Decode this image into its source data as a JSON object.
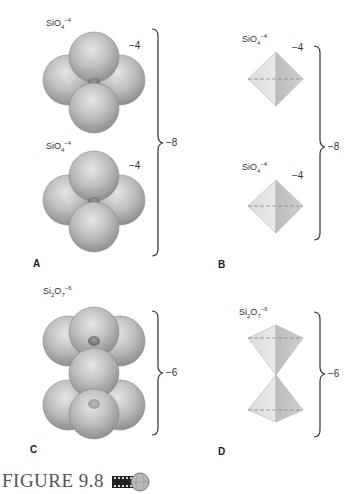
{
  "figure": {
    "caption": "FIGURE 9.8",
    "media_icon": "video-film-globe-icon"
  },
  "panels": {
    "A": {
      "label": "A",
      "top": {
        "formula_base": "SiO",
        "formula_sub": "4",
        "formula_sup": "−4",
        "charge": "−4"
      },
      "bottom": {
        "formula_base": "SiO",
        "formula_sub": "4",
        "formula_sup": "−4",
        "charge": "−4"
      },
      "total_charge": "−8",
      "style": "space-filling spheres"
    },
    "B": {
      "label": "B",
      "top": {
        "formula_base": "SiO",
        "formula_sub": "4",
        "formula_sup": "−4",
        "charge": "−4"
      },
      "bottom": {
        "formula_base": "SiO",
        "formula_sub": "4",
        "formula_sup": "−4",
        "charge": "−4"
      },
      "total_charge": "−8",
      "style": "tetrahedra"
    },
    "C": {
      "label": "C",
      "formula": {
        "p1": "Si",
        "s1": "2",
        "p2": "O",
        "s2": "7",
        "sup": "−6"
      },
      "total_charge": "−6",
      "style": "space-filling spheres"
    },
    "D": {
      "label": "D",
      "formula": {
        "p1": "Si",
        "s1": "2",
        "p2": "O",
        "s2": "7",
        "sup": "−6"
      },
      "total_charge": "−6",
      "style": "tetrahedra"
    }
  }
}
